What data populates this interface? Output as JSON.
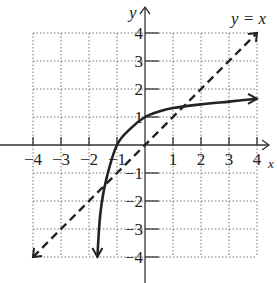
{
  "problem_label": "33.",
  "chart_data": {
    "type": "line",
    "title": "",
    "xlabel": "x",
    "ylabel": "y",
    "xlim": [
      -4,
      4
    ],
    "ylim": [
      -4,
      4
    ],
    "grid": true,
    "x_ticks": [
      "-4",
      "-3",
      "-2",
      "-1",
      "1",
      "2",
      "3",
      "4"
    ],
    "y_ticks": [
      "4",
      "3",
      "2",
      "1",
      "-1",
      "-2",
      "-3",
      "-4"
    ],
    "annotations": [
      "y = x"
    ],
    "series": [
      {
        "name": "curve",
        "style": "solid",
        "points": [
          [
            -1.7,
            -4
          ],
          [
            -1.6,
            -2.5
          ],
          [
            -1.4,
            -1.3
          ],
          [
            -1.0,
            0
          ],
          [
            -0.5,
            0.6
          ],
          [
            0,
            1
          ],
          [
            0.5,
            1.2
          ],
          [
            1,
            1.32
          ],
          [
            2,
            1.45
          ],
          [
            3,
            1.55
          ],
          [
            4,
            1.65
          ]
        ]
      },
      {
        "name": "y = x",
        "style": "dashed",
        "points": [
          [
            -4,
            -4
          ],
          [
            4,
            4
          ]
        ]
      }
    ]
  }
}
